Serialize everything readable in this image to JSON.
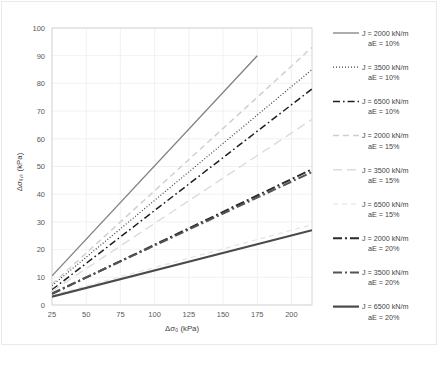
{
  "chart_data": {
    "type": "line",
    "title": "",
    "xlabel": "Δσ₀ (kPa)",
    "ylabel": "Δσᵥ,ₛ (kPa)",
    "xlim": [
      25,
      215
    ],
    "ylim": [
      0,
      100
    ],
    "xticks": [
      25,
      50,
      75,
      100,
      125,
      150,
      175,
      200
    ],
    "yticks": [
      0,
      10,
      20,
      30,
      40,
      50,
      60,
      70,
      80,
      90,
      100
    ],
    "grid": true,
    "legend_position": "right",
    "x": [
      25,
      215
    ],
    "series": [
      {
        "name": "J = 2000 kN/m  aE = 10%",
        "label_line1": "J = 2000 kN/m",
        "label_line2": "aE = 10%",
        "J": 2000,
        "aE": "10%",
        "style": "solid",
        "color": "#808080",
        "width": 1.3,
        "x_end": 175,
        "values": [
          10.5,
          90.0
        ],
        "y_at_x_end": 90.0
      },
      {
        "name": "J = 3500 kN/m  aE = 10%",
        "label_line1": "J = 3500 kN/m",
        "label_line2": "aE = 10%",
        "J": 3500,
        "aE": "10%",
        "style": "dotted",
        "color": "#3f3f3f",
        "width": 1.2,
        "x_end": 215,
        "values": [
          7.0,
          85.0
        ],
        "y_at_x_end": 85.0
      },
      {
        "name": "J = 6500 kN/m  aE = 10%",
        "label_line1": "J = 6500 kN/m",
        "label_line2": "aE = 10%",
        "J": 6500,
        "aE": "10%",
        "style": "dashdot",
        "color": "#1f1f1f",
        "width": 1.5,
        "x_end": 215,
        "values": [
          5.5,
          78.0
        ],
        "y_at_x_end": 78.0
      },
      {
        "name": "J = 2000 kN/m  aE = 15%",
        "label_line1": "J = 2000 kN/m",
        "label_line2": "aE = 15%",
        "J": 2000,
        "aE": "15%",
        "style": "dashed",
        "color": "#d0d0d0",
        "width": 1.5,
        "x_end": 215,
        "values": [
          7.5,
          93.0
        ],
        "y_at_x_end": 93.0
      },
      {
        "name": "J = 3500 kN/m  aE = 15%",
        "label_line1": "J = 3500 kN/m",
        "label_line2": "aE = 15%",
        "J": 3500,
        "aE": "15%",
        "style": "longdash",
        "color": "#dcdcdc",
        "width": 1.4,
        "x_end": 215,
        "values": [
          5.0,
          67.0
        ],
        "y_at_x_end": 67.0
      },
      {
        "name": "J = 6500 kN/m  aE = 15%",
        "label_line1": "J = 6500 kN/m",
        "label_line2": "aE = 15%",
        "J": 6500,
        "aE": "15%",
        "style": "dashed-fine",
        "color": "#e4e4e4",
        "width": 1.2,
        "x_end": 215,
        "values": [
          3.5,
          29.0
        ],
        "y_at_x_end": 29.0
      },
      {
        "name": "J = 2000 kN/m  aE = 20%",
        "label_line1": "J = 2000 kN/m",
        "label_line2": "aE = 20%",
        "J": 2000,
        "aE": "20%",
        "style": "thick-dashdot",
        "color": "#2b2b2b",
        "width": 2.0,
        "x_end": 215,
        "values": [
          4.0,
          49.0
        ],
        "y_at_x_end": 49.0
      },
      {
        "name": "J = 3500 kN/m  aE = 20%",
        "label_line1": "J = 3500 kN/m",
        "label_line2": "aE = 20%",
        "J": 3500,
        "aE": "20%",
        "style": "thick-dashdot-gray",
        "color": "#545454",
        "width": 2.0,
        "x_end": 215,
        "values": [
          4.2,
          48.0
        ],
        "y_at_x_end": 48.0
      },
      {
        "name": "J = 6500 kN/m  aE = 20%",
        "label_line1": "J = 6500 kN/m",
        "label_line2": "aE = 20%",
        "J": 6500,
        "aE": "20%",
        "style": "thick-solid",
        "color": "#4a4a4a",
        "width": 2.2,
        "x_end": 215,
        "values": [
          3.0,
          27.0
        ],
        "y_at_x_end": 27.0
      }
    ]
  },
  "caption": {
    "text": ""
  }
}
